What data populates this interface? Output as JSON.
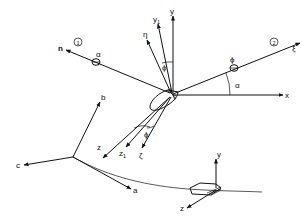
{
  "figure": {
    "main_frame": {
      "axes": {
        "x": "x",
        "y": "y",
        "z": "z",
        "y1": "y",
        "y1_sub": "1",
        "z1": "z",
        "z1_sub": "1",
        "eta": "η",
        "zeta": "ζ",
        "xi": "ξ",
        "n": "n"
      },
      "angles": {
        "alpha_main": "α",
        "alpha_blade": "α",
        "phi_upper": "ϕ",
        "phi_blade": "ϕ",
        "phi_lower": "ϕ"
      },
      "markers": {
        "marker_1": "1",
        "marker_2": "2"
      }
    },
    "ground_frame": {
      "axes": {
        "a": "a",
        "b": "b",
        "c": "c"
      }
    },
    "vehicle_frame": {
      "axes": {
        "y": "y",
        "z": "z"
      }
    }
  }
}
